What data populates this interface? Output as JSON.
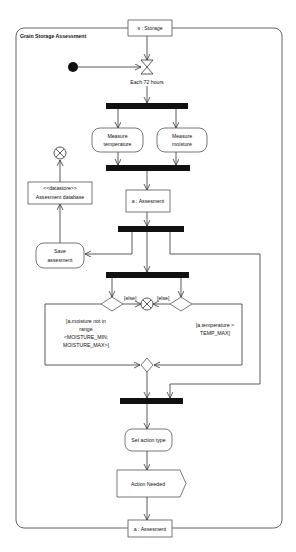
{
  "diagram": {
    "type": "UML activity diagram",
    "frame_title": "Grain Storage Assessment",
    "input_pin": "s : Storage",
    "output_pin": "a : Assesment",
    "time_event": "Each 72 hours",
    "actions": {
      "measure_temperature": [
        "Measure",
        "temperature"
      ],
      "measure_moisture": [
        "Measure",
        "moisture"
      ],
      "save_assessment": [
        "Save",
        "assesment"
      ],
      "set_action_type": "Set action type"
    },
    "object_node": "a : Assesment",
    "datastore": {
      "stereotype": "<<datastore>>",
      "name": "Assesment database"
    },
    "guards": {
      "left_else": "[else]",
      "right_else": "[else]",
      "moisture": [
        "[a.moisture not in",
        "range",
        "<MOISTURE_MIN;",
        "MOISTURE_MAX>]"
      ],
      "temperature": [
        "[a.temperature >",
        "TEMP_MAX]"
      ]
    },
    "signal": "Action Needed"
  }
}
